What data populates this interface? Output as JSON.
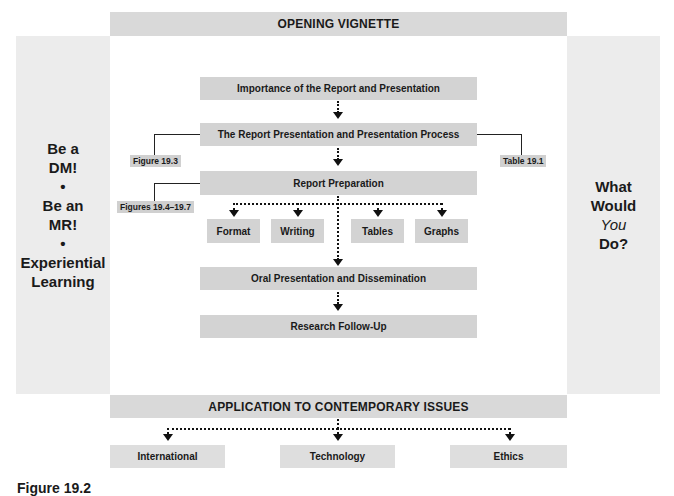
{
  "top_banner": {
    "label": "OPENING VIGNETTE"
  },
  "left_panel": {
    "items": [
      "Be a",
      "DM!",
      "•",
      "Be an",
      "MR!",
      "•",
      "Experiential",
      "Learning"
    ]
  },
  "right_panel": {
    "lines": [
      "What",
      "Would",
      "You",
      "Do?"
    ]
  },
  "flow": {
    "step1": "Importance of the Report and Presentation",
    "step2": "The Report Presentation and Presentation Process",
    "step3": "Report Preparation",
    "substeps": [
      "Format",
      "Writing",
      "Tables",
      "Graphs"
    ],
    "step4": "Oral Presentation and Dissemination",
    "step5": "Research Follow-Up"
  },
  "references": {
    "figure_19_3": "Figure 19.3",
    "table_19_1": "Table 19.1",
    "figures_19_4_19_7": "Figures 19.4–19.7"
  },
  "bottom_banner": {
    "label": "APPLICATION TO CONTEMPORARY ISSUES"
  },
  "issues": [
    "International",
    "Technology",
    "Ethics"
  ],
  "caption": "Figure 19.2"
}
